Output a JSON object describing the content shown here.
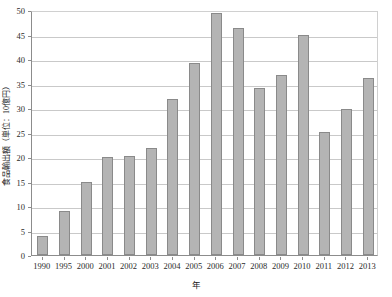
{
  "chart_data": {
    "type": "bar",
    "title": "",
    "subtitle": "",
    "xlabel": "年",
    "ylabel": "食品輸出額（単位：10億円）",
    "categories": [
      "1990",
      "1995",
      "2000",
      "2001",
      "2002",
      "2003",
      "2004",
      "2005",
      "2006",
      "2007",
      "2008",
      "2009",
      "2010",
      "2011",
      "2012",
      "2013"
    ],
    "values": [
      3.8,
      8.9,
      15.0,
      20.0,
      20.3,
      21.9,
      31.8,
      39.1,
      49.3,
      46.3,
      34.1,
      36.7,
      45.0,
      25.2,
      29.7,
      36.2
    ],
    "ylim": [
      0,
      50
    ],
    "ytick_values": [
      0,
      5,
      10,
      15,
      20,
      25,
      30,
      35,
      40,
      45,
      50
    ],
    "ytick_labels": [
      "0",
      "5",
      "10",
      "15",
      "20",
      "25",
      "30",
      "35",
      "40",
      "45",
      "50"
    ],
    "grid": "horizontal",
    "legend": "none",
    "bar_color": "#b4b4b4",
    "bar_edge_color": "#8a8a8a",
    "grid_color": "#c9c9c9",
    "axis_color": "#8c8c8c",
    "background_color": "#ffffff",
    "annotations": []
  }
}
